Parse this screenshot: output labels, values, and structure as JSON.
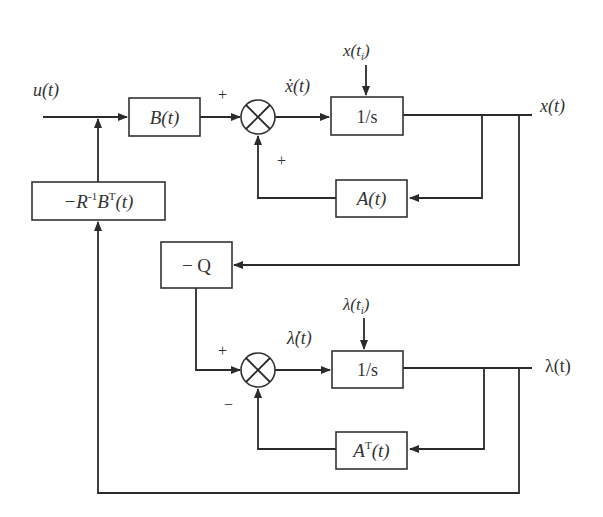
{
  "diagram": {
    "type": "block-diagram",
    "colors": {
      "line": "#2b2b2b",
      "text": "#333333",
      "background": "#ffffff"
    },
    "signals": {
      "input": "u(t)",
      "state_output": "x(t)",
      "costate_output": "λ(t)",
      "state_derivative": "ẋ(t)",
      "costate_derivative": "λ̇(t)",
      "state_initial": "x(t",
      "state_initial_sub": "i",
      "state_initial_close": ")",
      "costate_initial": "λ(t",
      "costate_initial_sub": "i",
      "costate_initial_close": ")"
    },
    "blocks": {
      "b": "B(t)",
      "integrator_state": "1/s",
      "a": "A(t)",
      "gain_prefix": "−R",
      "gain_sup1": "-1",
      "gain_mid": "B",
      "gain_sup2": "T",
      "gain_suffix": "(t)",
      "neg_q": "− Q",
      "integrator_costate": "1/s",
      "at_prefix": "A",
      "at_sup": "T",
      "at_suffix": "(t)"
    },
    "summers": {
      "state_sum_signs": {
        "left": "+",
        "bottom": "+"
      },
      "costate_sum_signs": {
        "left": "+",
        "bottom": "−"
      }
    }
  }
}
